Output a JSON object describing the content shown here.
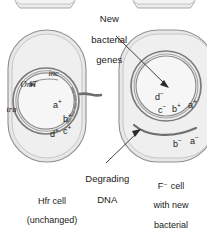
{
  "figure": {
    "topology": "two bacterial cells after Hfr conjugation",
    "annotations": {
      "new_genes": "New\nbacterial\ngenes",
      "degrading_dna": "Degrading\nDNA"
    },
    "captions": {
      "left": "Hfr cell\n(unchanged)",
      "right": "F⁻ cell\nwith new\nbacterial\ngenes:\na⁺ and b⁺"
    }
  },
  "left_cell": {
    "name": "Hfr cell",
    "plasmid_labels": [
      {
        "id": "inc",
        "text": "inc"
      },
      {
        "id": "orit",
        "text": "OriT"
      },
      {
        "id": "tra",
        "text": "tra"
      }
    ],
    "genes": [
      {
        "id": "a-plus",
        "base": "a",
        "charge": "+"
      },
      {
        "id": "b-plus",
        "base": "b",
        "charge": "+"
      },
      {
        "id": "d-plus",
        "base": "d",
        "charge": "+"
      },
      {
        "id": "c-plus",
        "base": "c",
        "charge": "+"
      }
    ]
  },
  "right_cell": {
    "name": "F minus cell",
    "chromosome_genes": [
      {
        "id": "d-minus",
        "base": "d",
        "charge": "−"
      },
      {
        "id": "c-minus",
        "base": "c",
        "charge": "−"
      },
      {
        "id": "b-plus",
        "base": "b",
        "charge": "+"
      },
      {
        "id": "a-plus",
        "base": "a",
        "charge": "+"
      }
    ],
    "fragment_genes": [
      {
        "id": "b-minus",
        "base": "b",
        "charge": "−"
      },
      {
        "id": "a-minus",
        "base": "a",
        "charge": "−"
      }
    ]
  },
  "colors": {
    "cell_fill": "#e9e9e9",
    "cell_stroke": "#8a8a8a",
    "cytoplasm_fill": "#efefef",
    "dna_stroke": "#6f6f6f",
    "dna_inner": "#9a9a9a",
    "leader": "#4a4a4a",
    "text": "#1a1a1a"
  }
}
